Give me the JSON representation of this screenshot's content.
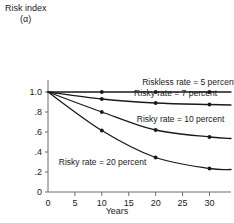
{
  "chart_data": {
    "type": "line",
    "title": "",
    "ylabel": "Risk index",
    "ylabel_symbol": "(α)",
    "xlabel": "Years",
    "xlim": [
      0,
      34
    ],
    "ylim": [
      0,
      1.12
    ],
    "grid": false,
    "legend_position": "inline-labels",
    "xticks": [
      "0",
      "5",
      "10",
      "15",
      "20",
      "25",
      "30"
    ],
    "xtick_values": [
      0,
      5,
      10,
      15,
      20,
      25,
      30
    ],
    "yticks": [
      "0",
      ".2",
      ".4",
      ".6",
      ".8",
      "1.0"
    ],
    "ytick_values": [
      0,
      0.2,
      0.4,
      0.6,
      0.8,
      1.0
    ],
    "x": [
      0,
      10,
      20,
      30,
      34
    ],
    "marker_x": [
      10,
      20,
      30
    ],
    "series": [
      {
        "name": "Riskless rate = 5 percent",
        "label": "Riskless rate = 5 percent",
        "values": [
          1.0,
          1.0,
          1.0,
          1.0,
          1.0
        ],
        "label_x": 17.5,
        "label_y": 1.07,
        "color": "#1a1a1a"
      },
      {
        "name": "Risky rate = 7 percent",
        "label": "Risky rate = 7 percent",
        "values": [
          1.0,
          0.93,
          0.89,
          0.875,
          0.87
        ],
        "label_x": 16.0,
        "label_y": 0.96,
        "color": "#1a1a1a"
      },
      {
        "name": "Risky rate = 10 percent",
        "label": "Risky rate = 10 percent",
        "values": [
          1.0,
          0.8,
          0.62,
          0.55,
          0.535
        ],
        "label_x": 16.5,
        "label_y": 0.7,
        "color": "#1a1a1a"
      },
      {
        "name": "Risky rate = 20 percent",
        "label": "Risky rate = 20 percent",
        "values": [
          1.0,
          0.615,
          0.345,
          0.235,
          0.225
        ],
        "label_x": 2.0,
        "label_y": 0.27,
        "color": "#1a1a1a"
      }
    ]
  }
}
